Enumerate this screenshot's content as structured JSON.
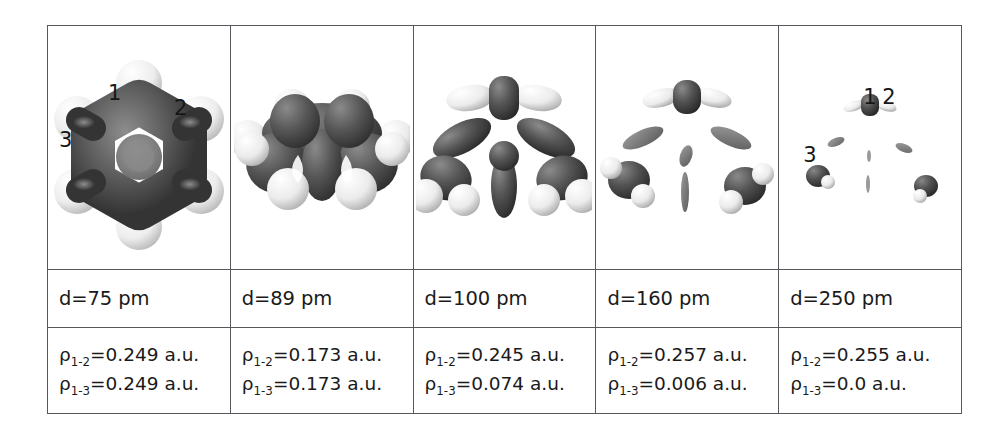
{
  "figure": {
    "type": "table",
    "caption_present": false,
    "columns": 5,
    "rows": 3,
    "row_roles": [
      "isosurface-render",
      "distance-label",
      "density-values"
    ],
    "atom_labels": [
      "1",
      "2",
      "3"
    ],
    "colors": {
      "border": "#55585c",
      "text": "#1a1a1a",
      "background": "#ffffff",
      "carbon_surface": "#595959",
      "hydrogen_surface": "#f2f2f2"
    },
    "cells": [
      {
        "id": "col1",
        "distance": "d=75 pm",
        "rho_12": "=0.249 a.u.",
        "rho_13": "=0.249 a.u.",
        "rho_symbol": "ρ",
        "sub_12": "1-2",
        "sub_13": "1-3",
        "labels_shown": [
          "1",
          "2",
          "3"
        ],
        "description": "continuous flower-like benzene electron density isosurface, ring closed"
      },
      {
        "id": "col2",
        "distance": "d=89 pm",
        "rho_12": "=0.173 a.u.",
        "rho_13": "=0.173 a.u.",
        "rho_symbol": "ρ",
        "sub_12": "1-2",
        "sub_13": "1-3",
        "labels_shown": [],
        "description": "benzene isosurface, ring centre opening, lobes still merged"
      },
      {
        "id": "col3",
        "distance": "d=100 pm",
        "rho_12": "=0.245 a.u.",
        "rho_13": "=0.074 a.u.",
        "rho_symbol": "ρ",
        "sub_12": "1-2",
        "sub_13": "1-3",
        "labels_shown": [],
        "description": "surface split into three-lobed central fragment plus separate CH groups"
      },
      {
        "id": "col4",
        "distance": "d=160 pm",
        "rho_12": "=0.257 a.u.",
        "rho_13": "=0.006 a.u.",
        "rho_symbol": "ρ",
        "sub_12": "1-2",
        "sub_13": "1-3",
        "labels_shown": [],
        "description": "three isolated CH fragments with small disconnected bond blobs"
      },
      {
        "id": "col5",
        "distance": "d=250 pm",
        "rho_12": "=0.255 a.u.",
        "rho_13": "=0.0 a.u.",
        "rho_symbol": "ρ",
        "sub_12": "1-2",
        "sub_13": "1-3",
        "labels_shown": [
          "1",
          "2",
          "3"
        ],
        "description": "tiny residual atom kernels only, bonds vanished"
      }
    ]
  }
}
